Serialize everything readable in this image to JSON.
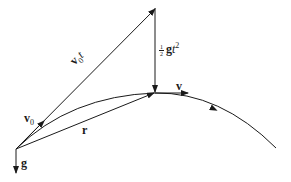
{
  "diagram": {
    "colors": {
      "stroke": "#1a1a1a",
      "background": "#ffffff"
    },
    "labels": {
      "v0t": {
        "vec": "v",
        "sub": "0",
        "scalar": "t"
      },
      "half_gt2": {
        "num": "1",
        "den": "2",
        "vec": "g",
        "scalar": "t",
        "sup": "2"
      },
      "v": {
        "vec": "v"
      },
      "v0": {
        "vec": "v",
        "sub": "0"
      },
      "r": {
        "vec": "r"
      },
      "g": {
        "vec": "g"
      }
    },
    "points": {
      "origin": [
        16,
        149
      ],
      "apex": [
        155,
        8
      ],
      "position": [
        155,
        93
      ],
      "trajectory_end": [
        276,
        148
      ]
    }
  }
}
